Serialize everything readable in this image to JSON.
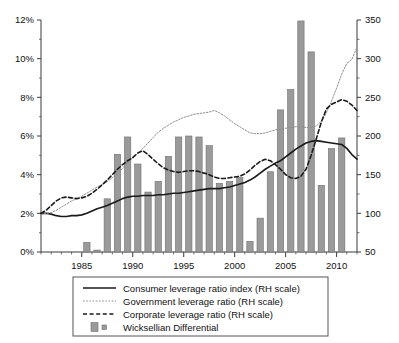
{
  "chart_data": {
    "type": "bar",
    "title": "",
    "subtitle": "",
    "xlabel": "",
    "ylabel": "",
    "y2label": "",
    "grid": false,
    "legend_position": "bottom",
    "xlim": [
      1981,
      2012
    ],
    "ylim": [
      0,
      12
    ],
    "y2lim": [
      50,
      350
    ],
    "ytick_labels": [
      "0%",
      "2%",
      "4%",
      "6%",
      "8%",
      "10%",
      "12%"
    ],
    "ytick_values": [
      0,
      2,
      4,
      6,
      8,
      10,
      12
    ],
    "y2tick_labels": [
      "50",
      "100",
      "150",
      "200",
      "250",
      "300",
      "350"
    ],
    "y2tick_values": [
      50,
      100,
      150,
      200,
      250,
      300,
      350
    ],
    "xtick_labels": [
      "1985",
      "1990",
      "1995",
      "2000",
      "2005",
      "2010"
    ],
    "xtick_values": [
      1985,
      1990,
      1995,
      2000,
      2005,
      2010
    ],
    "categories": [
      1981,
      1982,
      1983,
      1984,
      1985,
      1986,
      1987,
      1988,
      1989,
      1990,
      1991,
      1992,
      1993,
      1994,
      1995,
      1996,
      1997,
      1998,
      1999,
      2000,
      2001,
      2002,
      2003,
      2004,
      2005,
      2006,
      2007,
      2008,
      2009,
      2010,
      2011
    ],
    "bars": {
      "name": "Wicksellian Differential",
      "axis": "left",
      "unit": "%",
      "values": [
        0,
        0,
        0,
        0,
        0.5,
        0.1,
        2.75,
        5.05,
        5.95,
        4.55,
        3.1,
        3.65,
        4.95,
        5.95,
        6.0,
        5.95,
        5.5,
        3.55,
        3.65,
        3.85,
        0.55,
        1.75,
        4.15,
        7.35,
        8.4,
        11.95,
        10.35,
        3.45,
        5.35,
        5.9,
        0
      ]
    },
    "series": [
      {
        "name": "Consumer leverage ratio index (RH scale)",
        "axis": "right",
        "style": "solid",
        "x": [
          1981,
          1981.5,
          1982,
          1982.5,
          1983,
          1983.5,
          1984,
          1984.5,
          1985,
          1985.5,
          1986,
          1986.5,
          1987,
          1987.5,
          1988,
          1988.5,
          1989,
          1989.5,
          1990,
          1990.5,
          1991,
          1991.5,
          1992,
          1992.5,
          1993,
          1993.5,
          1994,
          1994.5,
          1995,
          1995.5,
          1996,
          1996.5,
          1997,
          1997.5,
          1998,
          1998.5,
          1999,
          1999.5,
          2000,
          2000.5,
          2001,
          2001.5,
          2002,
          2002.5,
          2003,
          2003.5,
          2004,
          2004.5,
          2005,
          2005.5,
          2006,
          2006.5,
          2007,
          2007.5,
          2008,
          2008.5,
          2009,
          2009.5,
          2010,
          2010.5,
          2011,
          2011.5,
          2012
        ],
        "values": [
          100,
          100,
          99,
          97,
          96,
          96,
          97,
          97,
          98,
          100,
          103,
          106,
          108,
          110,
          113,
          116,
          119,
          121,
          122,
          122,
          123,
          123,
          123,
          124,
          124,
          125,
          126,
          126,
          127,
          128,
          129,
          130,
          131,
          132,
          132,
          132,
          133,
          134,
          136,
          138,
          140,
          143,
          147,
          152,
          157,
          161,
          165,
          168,
          173,
          178,
          183,
          187,
          191,
          193,
          194,
          193,
          192,
          191,
          190,
          189,
          184,
          176,
          170
        ]
      },
      {
        "name": "Government leverage ratio (RH scale)",
        "axis": "right",
        "style": "dotted",
        "x": [
          1981,
          1981.5,
          1982,
          1982.5,
          1983,
          1983.5,
          1984,
          1984.5,
          1985,
          1985.5,
          1986,
          1986.5,
          1987,
          1987.5,
          1988,
          1988.5,
          1989,
          1989.5,
          1990,
          1990.5,
          1991,
          1991.5,
          1992,
          1992.5,
          1993,
          1993.5,
          1994,
          1994.5,
          1995,
          1995.5,
          1996,
          1996.5,
          1997,
          1997.5,
          1998,
          1998.5,
          1999,
          1999.5,
          2000,
          2000.5,
          2001,
          2001.5,
          2002,
          2002.5,
          2003,
          2003.5,
          2004,
          2004.5,
          2005,
          2005.5,
          2006,
          2006.5,
          2007,
          2007.5,
          2008,
          2008.5,
          2009,
          2009.5,
          2010,
          2010.5,
          2011,
          2011.5,
          2012
        ],
        "values": [
          99,
          100,
          101,
          104,
          108,
          112,
          116,
          119,
          122,
          126,
          130,
          134,
          137,
          141,
          146,
          152,
          158,
          166,
          172,
          178,
          184,
          191,
          198,
          205,
          210,
          214,
          218,
          221,
          224,
          226,
          228,
          229,
          230,
          231,
          233,
          230,
          226,
          221,
          216,
          212,
          208,
          204,
          203,
          203,
          204,
          206,
          208,
          209,
          210,
          211,
          212,
          212,
          211,
          211,
          213,
          219,
          230,
          245,
          262,
          280,
          294,
          299,
          315
        ]
      },
      {
        "name": "Corporate leverage ratio (RH scale)",
        "axis": "right",
        "style": "dashed",
        "x": [
          1981,
          1981.5,
          1982,
          1982.5,
          1983,
          1983.5,
          1984,
          1984.5,
          1985,
          1985.5,
          1986,
          1986.5,
          1987,
          1987.5,
          1988,
          1988.5,
          1989,
          1989.5,
          1990,
          1990.5,
          1991,
          1991.5,
          1992,
          1992.5,
          1993,
          1993.5,
          1994,
          1994.5,
          1995,
          1995.5,
          1996,
          1996.5,
          1997,
          1997.5,
          1998,
          1998.5,
          1999,
          1999.5,
          2000,
          2000.5,
          2001,
          2001.5,
          2002,
          2002.5,
          2003,
          2003.5,
          2004,
          2004.5,
          2005,
          2005.5,
          2006,
          2006.5,
          2007,
          2007.5,
          2008,
          2008.5,
          2009,
          2009.5,
          2010,
          2010.5,
          2011,
          2011.5,
          2012
        ],
        "values": [
          100,
          104,
          110,
          116,
          120,
          121,
          120,
          119,
          120,
          122,
          126,
          131,
          137,
          143,
          150,
          157,
          163,
          168,
          172,
          178,
          181,
          176,
          170,
          164,
          159,
          156,
          154,
          153,
          154,
          155,
          155,
          154,
          152,
          150,
          147,
          145,
          145,
          146,
          147,
          148,
          151,
          156,
          162,
          167,
          170,
          168,
          163,
          157,
          150,
          146,
          145,
          148,
          157,
          175,
          196,
          218,
          235,
          241,
          244,
          247,
          245,
          240,
          233
        ]
      }
    ]
  },
  "legend": {
    "items": [
      {
        "label": "Consumer leverage ratio index (RH scale)",
        "marker": "solid-line-swatch"
      },
      {
        "label": "Government leverage ratio (RH scale)",
        "marker": "dotted-line-swatch"
      },
      {
        "label": "Corporate leverage ratio (RH scale)",
        "marker": "dashed-line-swatch"
      },
      {
        "label": "Wicksellian Differential",
        "marker": "bar-swatch"
      }
    ]
  },
  "colors": {
    "bar_fill": "#9a9a9a",
    "bar_stroke": "#6f6f6f",
    "consumer_line": "#1a1a1a",
    "government_line": "#8d8d8d",
    "corporate_line": "#1a1a1a",
    "axis": "#3a3a3a",
    "legend_border": "#555555",
    "background": "#ffffff"
  }
}
